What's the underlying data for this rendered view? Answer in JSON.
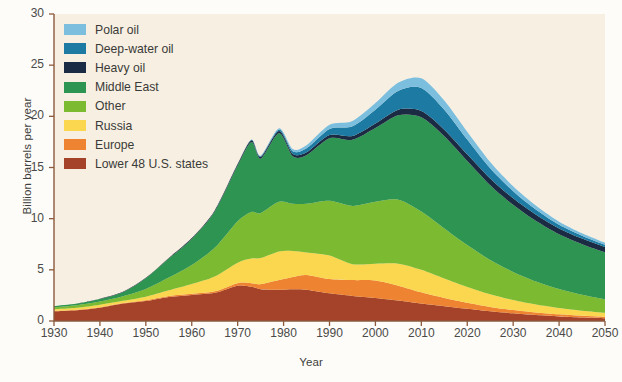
{
  "chart_data": {
    "type": "area",
    "stacked": true,
    "title": "",
    "xlabel": "Year",
    "ylabel": "Billion barrels per year",
    "xlim": [
      1930,
      2050
    ],
    "ylim": [
      0,
      30
    ],
    "xticks": [
      1930,
      1940,
      1950,
      1960,
      1970,
      1980,
      1990,
      2000,
      2010,
      2020,
      2030,
      2040,
      2050
    ],
    "yticks": [
      0,
      5,
      10,
      15,
      20,
      25,
      30
    ],
    "grid": false,
    "legend_position": "upper-left",
    "stack_order_bottom_to_top": [
      "Lower 48 U.S. states",
      "Europe",
      "Russia",
      "Other",
      "Middle East",
      "Heavy oil",
      "Deep-water oil",
      "Polar oil"
    ],
    "x": [
      1930,
      1935,
      1940,
      1945,
      1950,
      1955,
      1960,
      1965,
      1970,
      1973,
      1975,
      1979,
      1982,
      1985,
      1990,
      1995,
      2000,
      2005,
      2010,
      2015,
      2020,
      2025,
      2030,
      2035,
      2040,
      2045,
      2050
    ],
    "series": [
      {
        "name": "Lower 48 U.S. states",
        "color": "#a4422a",
        "values": [
          0.95,
          1.05,
          1.3,
          1.7,
          1.95,
          2.35,
          2.55,
          2.75,
          3.45,
          3.35,
          3.1,
          3.05,
          3.1,
          3.05,
          2.7,
          2.45,
          2.25,
          2.0,
          1.7,
          1.45,
          1.2,
          0.95,
          0.75,
          0.58,
          0.45,
          0.35,
          0.28
        ]
      },
      {
        "name": "Europe",
        "color": "#ee8432",
        "values": [
          0.05,
          0.05,
          0.05,
          0.05,
          0.08,
          0.1,
          0.12,
          0.15,
          0.25,
          0.35,
          0.5,
          0.95,
          1.2,
          1.45,
          1.4,
          1.55,
          1.7,
          1.45,
          1.1,
          0.8,
          0.58,
          0.42,
          0.32,
          0.25,
          0.2,
          0.16,
          0.13
        ]
      },
      {
        "name": "Russia",
        "color": "#fbd750",
        "values": [
          0.15,
          0.2,
          0.25,
          0.22,
          0.35,
          0.55,
          0.95,
          1.45,
          2.0,
          2.4,
          2.55,
          2.8,
          2.55,
          2.2,
          2.3,
          1.55,
          1.65,
          2.15,
          2.2,
          1.9,
          1.55,
          1.25,
          0.98,
          0.78,
          0.62,
          0.5,
          0.4
        ]
      },
      {
        "name": "Other",
        "color": "#7cbb31",
        "values": [
          0.2,
          0.25,
          0.3,
          0.45,
          0.75,
          1.25,
          1.85,
          2.8,
          4.05,
          4.55,
          4.4,
          4.85,
          4.6,
          4.75,
          5.35,
          5.7,
          6.05,
          6.25,
          5.7,
          4.9,
          4.1,
          3.35,
          2.75,
          2.25,
          1.85,
          1.55,
          1.3
        ]
      },
      {
        "name": "Middle East",
        "color": "#2e9451",
        "values": [
          0.1,
          0.15,
          0.25,
          0.4,
          1.05,
          1.85,
          2.55,
          3.55,
          5.45,
          6.85,
          5.3,
          6.7,
          4.65,
          4.75,
          6.1,
          6.45,
          7.2,
          8.25,
          9.2,
          9.0,
          8.2,
          7.3,
          6.55,
          5.9,
          5.35,
          4.95,
          4.6
        ]
      },
      {
        "name": "Heavy oil",
        "color": "#1c2b44",
        "values": [
          0.02,
          0.02,
          0.03,
          0.04,
          0.05,
          0.06,
          0.08,
          0.1,
          0.14,
          0.16,
          0.18,
          0.22,
          0.25,
          0.28,
          0.32,
          0.38,
          0.45,
          0.55,
          0.62,
          0.65,
          0.66,
          0.66,
          0.64,
          0.62,
          0.58,
          0.55,
          0.52
        ]
      },
      {
        "name": "Deep-water oil",
        "color": "#1c7aa3",
        "values": [
          0.0,
          0.0,
          0.0,
          0.0,
          0.0,
          0.0,
          0.0,
          0.0,
          0.02,
          0.05,
          0.08,
          0.15,
          0.25,
          0.4,
          0.6,
          0.95,
          1.35,
          1.85,
          2.25,
          1.95,
          1.45,
          1.0,
          0.7,
          0.5,
          0.36,
          0.28,
          0.22
        ]
      },
      {
        "name": "Polar oil",
        "color": "#7cbede",
        "values": [
          0.0,
          0.0,
          0.0,
          0.0,
          0.0,
          0.0,
          0.0,
          0.0,
          0.0,
          0.02,
          0.05,
          0.12,
          0.2,
          0.3,
          0.4,
          0.52,
          0.65,
          0.8,
          0.95,
          0.9,
          0.75,
          0.6,
          0.48,
          0.38,
          0.3,
          0.24,
          0.2
        ]
      }
    ],
    "totals": [
      1.47,
      1.72,
      2.18,
      2.86,
      4.23,
      6.16,
      8.1,
      10.8,
      15.36,
      17.73,
      16.16,
      18.84,
      16.8,
      17.18,
      19.17,
      19.55,
      21.3,
      23.3,
      23.72,
      21.55,
      18.49,
      15.53,
      13.17,
      11.26,
      9.71,
      8.58,
      7.65
    ]
  },
  "axes": {
    "ylabel": "Billion barrels per year",
    "xlabel": "Year",
    "ytick_labels": [
      "30",
      "25",
      "20",
      "15",
      "10",
      "5",
      "0"
    ],
    "xtick_labels": [
      "1930",
      "1940",
      "1950",
      "1960",
      "1970",
      "1980",
      "1990",
      "2000",
      "2010",
      "2020",
      "2030",
      "2040",
      "2050"
    ]
  },
  "legend": {
    "items": [
      {
        "label": "Polar oil",
        "color": "#7cbede"
      },
      {
        "label": "Deep-water oil",
        "color": "#1c7aa3"
      },
      {
        "label": "Heavy oil",
        "color": "#1c2b44"
      },
      {
        "label": "Middle East",
        "color": "#2e9451"
      },
      {
        "label": "Other",
        "color": "#7cbb31"
      },
      {
        "label": "Russia",
        "color": "#fbd750"
      },
      {
        "label": "Europe",
        "color": "#ee8432"
      },
      {
        "label": "Lower 48 U.S. states",
        "color": "#a4422a"
      }
    ]
  },
  "colors": {
    "plot_background": "#f7f0e2",
    "page_background": "#fdfcf8",
    "axis": "#8b5a3c",
    "text": "#3f3f3d"
  }
}
